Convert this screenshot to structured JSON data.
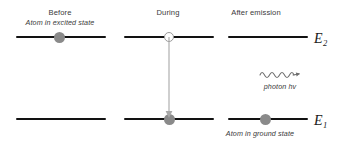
{
  "diagram": {
    "columns": [
      {
        "id": "before",
        "title": "Before",
        "subtitle": "Atom in excited state",
        "upper_level_occupied": true,
        "lower_level_occupied": false
      },
      {
        "id": "during",
        "title": "During",
        "subtitle": "",
        "upper_level_occupied": false,
        "lower_level_occupied": true
      },
      {
        "id": "after",
        "title": "After emission",
        "subtitle": "Atom in ground state",
        "upper_level_occupied": false,
        "lower_level_occupied": true
      }
    ],
    "energy_levels": [
      {
        "id": "upper",
        "label": "E",
        "subscript": "2"
      },
      {
        "id": "lower",
        "label": "E",
        "subscript": "1"
      }
    ],
    "photon": {
      "caption": "photon hv",
      "wave_cycles": 4,
      "direction": "right"
    },
    "transition": {
      "direction": "down",
      "from_level": "E2",
      "to_level": "E1"
    },
    "colors": {
      "level_line": "#121212",
      "electron_filled": "#8a8a8a",
      "electron_hollow_fill": "#ffffff",
      "electron_hollow_stroke": "#9a9a9a",
      "arrow": "#a8a8a8",
      "photon": "#6e6e6e",
      "text": "#3a3a3a",
      "background": "#ffffff"
    }
  }
}
